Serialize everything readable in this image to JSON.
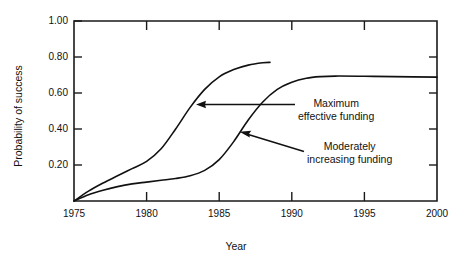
{
  "chart_data": {
    "type": "line",
    "title": "",
    "xlabel": "Year",
    "ylabel": "Probability of success",
    "xlim": [
      1975,
      2000
    ],
    "ylim": [
      0.0,
      1.0
    ],
    "grid": false,
    "legend_position": "inline-annotations",
    "xticks": [
      1975,
      1980,
      1985,
      1990,
      1995,
      2000
    ],
    "xtick_labels": [
      "1975",
      "1980",
      "1985",
      "1990",
      "1995",
      "2000"
    ],
    "yticks": [
      0.2,
      0.4,
      0.6,
      0.8,
      1.0
    ],
    "ytick_labels": [
      "0.20",
      "0.40",
      "0.60",
      "0.80",
      "1.00"
    ],
    "series": [
      {
        "name": "Maximum effective funding",
        "x": [
          1975,
          1976,
          1977,
          1978,
          1979,
          1980,
          1981,
          1982,
          1983,
          1984,
          1985,
          1986,
          1987,
          1988,
          1988.5
        ],
        "values": [
          0.0,
          0.055,
          0.1,
          0.14,
          0.18,
          0.22,
          0.29,
          0.4,
          0.52,
          0.62,
          0.69,
          0.73,
          0.755,
          0.768,
          0.77
        ]
      },
      {
        "name": "Moderately increasing funding",
        "x": [
          1975,
          1976,
          1977,
          1978,
          1979,
          1980,
          1981,
          1982,
          1983,
          1984,
          1985,
          1986,
          1987,
          1988,
          1989,
          1990,
          1991,
          1992,
          1993,
          1995,
          1997,
          2000
        ],
        "values": [
          0.0,
          0.035,
          0.06,
          0.08,
          0.095,
          0.105,
          0.115,
          0.125,
          0.14,
          0.17,
          0.23,
          0.33,
          0.45,
          0.55,
          0.62,
          0.66,
          0.682,
          0.691,
          0.694,
          0.693,
          0.691,
          0.688
        ]
      }
    ],
    "annotations": [
      {
        "id": "annot-0",
        "lines": [
          "Maximum",
          "effective funding"
        ],
        "target_x": 1983.2,
        "target_y": 0.525
      },
      {
        "id": "annot-1",
        "lines": [
          "Moderately",
          "increasing funding"
        ],
        "target_x": 1986.9,
        "target_y": 0.472
      }
    ]
  },
  "colors": {
    "line": "#111111",
    "axis": "#1a1a1a",
    "background": "#ffffff"
  }
}
